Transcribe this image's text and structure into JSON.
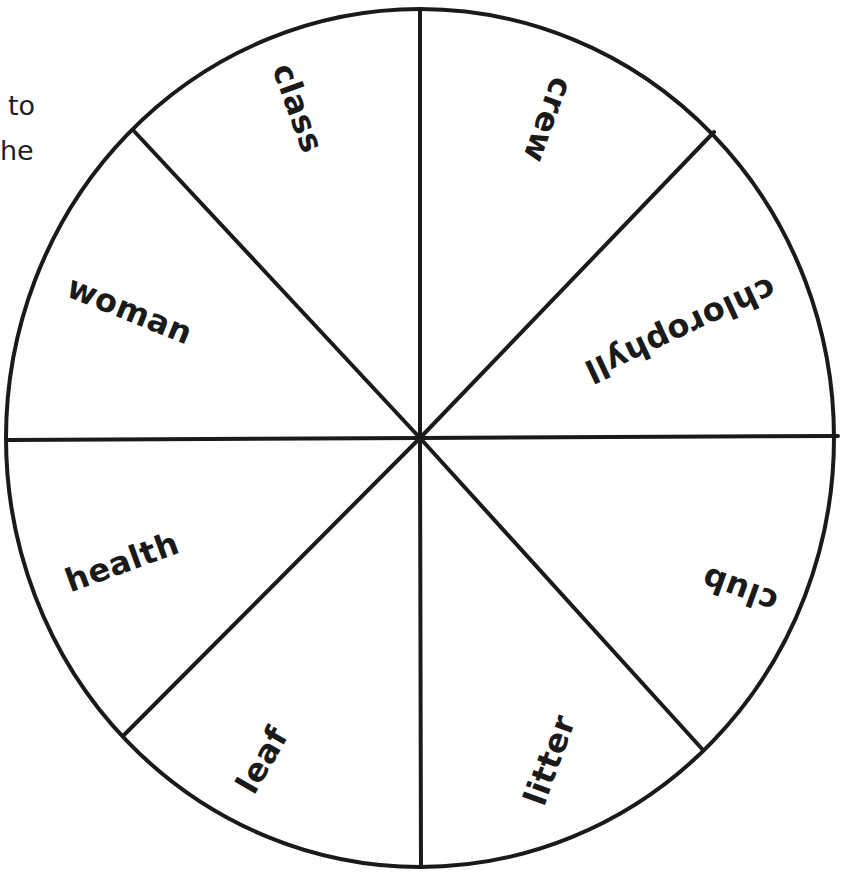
{
  "side_text_fragments": [
    {
      "text": "to",
      "x": 8,
      "y": 92
    },
    {
      "text": "he",
      "x": 0,
      "y": 137
    }
  ],
  "wheel": {
    "center": {
      "x": 420,
      "y": 438
    },
    "radius_x": 414,
    "radius_y": 429,
    "stroke_color": "#1a1a1a",
    "stroke_width": 4,
    "segments": 8,
    "spokes": [
      {
        "x": 420,
        "y": 9
      },
      {
        "x": 714,
        "y": 132
      },
      {
        "x": 838,
        "y": 436
      },
      {
        "x": 703,
        "y": 750
      },
      {
        "x": 421,
        "y": 867
      },
      {
        "x": 124,
        "y": 735
      },
      {
        "x": 9,
        "y": 440
      },
      {
        "x": 133,
        "y": 130
      }
    ],
    "labels": [
      {
        "text": "class",
        "cx": 298,
        "cy": 108,
        "rotate": 70
      },
      {
        "text": "crew",
        "cx": 548,
        "cy": 120,
        "rotate": 110
      },
      {
        "text": "chlorophyll",
        "cx": 680,
        "cy": 330,
        "rotate": 155
      },
      {
        "text": "club",
        "cx": 740,
        "cy": 590,
        "rotate": 200
      },
      {
        "text": "litter",
        "cx": 550,
        "cy": 760,
        "rotate": -70
      },
      {
        "text": "leaf",
        "cx": 262,
        "cy": 760,
        "rotate": -60
      },
      {
        "text": "health",
        "cx": 122,
        "cy": 562,
        "rotate": -20
      },
      {
        "text": "woman",
        "cx": 130,
        "cy": 310,
        "rotate": 22
      }
    ]
  }
}
